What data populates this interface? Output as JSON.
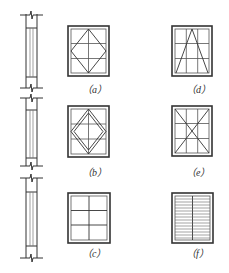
{
  "figure": {
    "stroke_color": "#333333",
    "light_stroke_color": "#777777",
    "panels": [
      {
        "id": "a",
        "label": "（a）",
        "pattern": "diamond-over-grid"
      },
      {
        "id": "b",
        "label": "（b）",
        "pattern": "double-diamond-over-grid"
      },
      {
        "id": "c",
        "label": "（c）",
        "pattern": "two-by-three-grid"
      },
      {
        "id": "d",
        "label": "（d）",
        "pattern": "triangle-over-grid"
      },
      {
        "id": "e",
        "label": "（e）",
        "pattern": "x-cross-over-grid"
      },
      {
        "id": "f",
        "label": "（f）",
        "pattern": "horizontal-louvers"
      }
    ],
    "wall_section": {
      "segments": 3,
      "break_marks": true
    }
  }
}
